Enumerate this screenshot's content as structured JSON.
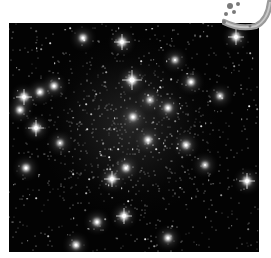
{
  "image": {
    "subject": "star cluster field",
    "background_color": "#030303",
    "frame_color": "#ffffff",
    "star_color": "#ffffff"
  },
  "bright_stars": [
    {
      "x": 132,
      "y": 80,
      "r": 5
    },
    {
      "x": 236,
      "y": 37,
      "r": 4
    },
    {
      "x": 24,
      "y": 97,
      "r": 4
    },
    {
      "x": 36,
      "y": 128,
      "r": 4
    },
    {
      "x": 112,
      "y": 179,
      "r": 4
    },
    {
      "x": 124,
      "y": 216,
      "r": 4
    },
    {
      "x": 247,
      "y": 181,
      "r": 4
    },
    {
      "x": 122,
      "y": 42,
      "r": 4
    },
    {
      "x": 133,
      "y": 117,
      "r": 3
    },
    {
      "x": 191,
      "y": 82,
      "r": 3
    },
    {
      "x": 20,
      "y": 110,
      "r": 3
    },
    {
      "x": 54,
      "y": 86,
      "r": 3
    },
    {
      "x": 186,
      "y": 145,
      "r": 3
    },
    {
      "x": 126,
      "y": 168,
      "r": 3
    },
    {
      "x": 97,
      "y": 222,
      "r": 3
    },
    {
      "x": 148,
      "y": 140,
      "r": 3
    },
    {
      "x": 168,
      "y": 108,
      "r": 3
    },
    {
      "x": 40,
      "y": 92,
      "r": 3
    },
    {
      "x": 83,
      "y": 38,
      "r": 3
    },
    {
      "x": 220,
      "y": 96,
      "r": 2
    },
    {
      "x": 168,
      "y": 238,
      "r": 3
    },
    {
      "x": 76,
      "y": 245,
      "r": 3
    },
    {
      "x": 26,
      "y": 168,
      "r": 3
    },
    {
      "x": 205,
      "y": 165,
      "r": 2
    },
    {
      "x": 60,
      "y": 143,
      "r": 2
    },
    {
      "x": 150,
      "y": 100,
      "r": 2
    },
    {
      "x": 175,
      "y": 60,
      "r": 2
    }
  ],
  "ornament": {
    "description": "gray decorative arc with small star figure",
    "color": "#9a9a9a"
  }
}
